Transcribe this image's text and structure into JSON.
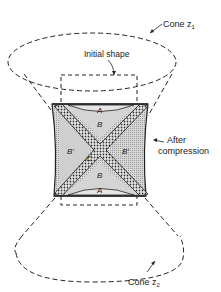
{
  "labels": {
    "cone_top": "Cone z",
    "cone_top_sub": "1",
    "cone_bottom": "Cone z",
    "cone_bottom_sub": "2",
    "initial_shape": "Initial shape",
    "after_line1": "After",
    "after_line2": "compression",
    "region_A_top": "A",
    "region_A_bottom": "A",
    "region_B_top": "B",
    "region_B_bottom": "B",
    "region_Bp_left": "B'",
    "region_Bp_right": "B'",
    "region_C": "C"
  },
  "colors": {
    "line": "#222222",
    "shade_light": "#d4d4d4",
    "shade_mid": "#b8b8b8"
  }
}
